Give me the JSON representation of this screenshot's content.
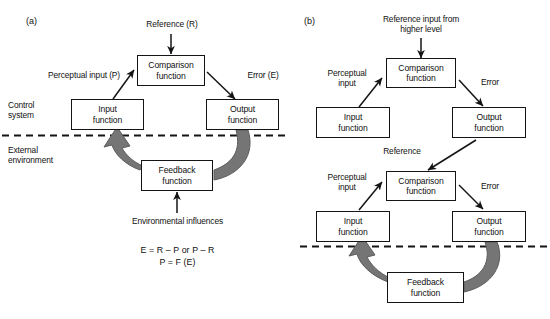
{
  "figure": {
    "panels": [
      {
        "id": "a",
        "label": "(a)",
        "region_labels": [
          {
            "name": "control-system",
            "lines": [
              "Control",
              "system"
            ]
          },
          {
            "name": "external-environment",
            "lines": [
              "External",
              "environment"
            ]
          }
        ],
        "nodes": [
          {
            "name": "comparison-function",
            "line1": "Comparison",
            "line2": "function"
          },
          {
            "name": "input-function",
            "line1": "Input",
            "line2": "function"
          },
          {
            "name": "output-function",
            "line1": "Output",
            "line2": "function"
          },
          {
            "name": "feedback-function",
            "line1": "Feedback",
            "line2": "function"
          }
        ],
        "edge_labels": [
          {
            "name": "reference-label",
            "text": "Reference (R)"
          },
          {
            "name": "perceptual-input-label",
            "text": "Perceptual input (P)"
          },
          {
            "name": "error-label",
            "text": "Error (E)"
          },
          {
            "name": "environmental-influences-label",
            "text": "Environmental influences"
          }
        ],
        "equations": [
          "E = R – P or P – R",
          "P = F (E)"
        ]
      },
      {
        "id": "b",
        "label": "(b)",
        "nodes": [
          {
            "name": "comparison-function-upper",
            "line1": "Comparison",
            "line2": "function"
          },
          {
            "name": "input-function-upper",
            "line1": "Input",
            "line2": "function"
          },
          {
            "name": "output-function-upper",
            "line1": "Output",
            "line2": "function"
          },
          {
            "name": "comparison-function-lower",
            "line1": "Comparison",
            "line2": "function"
          },
          {
            "name": "input-function-lower",
            "line1": "Input",
            "line2": "function"
          },
          {
            "name": "output-function-lower",
            "line1": "Output",
            "line2": "function"
          },
          {
            "name": "feedback-function",
            "line1": "Feedback",
            "line2": "function"
          }
        ],
        "edge_labels": [
          {
            "name": "reference-input-label",
            "line1": "Reference input from",
            "line2": "higher level"
          },
          {
            "name": "perceptual-input-upper",
            "line1": "Perceptual",
            "line2": "input"
          },
          {
            "name": "error-upper",
            "text": "Error"
          },
          {
            "name": "reference-mid",
            "text": "Reference"
          },
          {
            "name": "perceptual-input-lower",
            "line1": "Perceptual",
            "line2": "input"
          },
          {
            "name": "error-lower",
            "text": "Error"
          }
        ]
      }
    ],
    "colors": {
      "stroke": "#141414",
      "box_fill": "#ffffff",
      "feedback_arrow_fill": "#757575",
      "feedback_arrow_stroke": "#5c5c5c",
      "boundary_dash": "#141414",
      "text": "#111111"
    }
  }
}
